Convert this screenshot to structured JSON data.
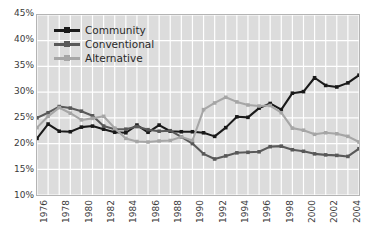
{
  "chart_data": {
    "type": "line",
    "title": "",
    "xlabel": "",
    "ylabel": "",
    "grid": true,
    "legend_position": "top-left",
    "ylim": [
      10,
      45
    ],
    "ytick_values": [
      45,
      40,
      35,
      30,
      25,
      20,
      15,
      10
    ],
    "ytick_labels": [
      "45%",
      "40%",
      "35%",
      "30%",
      "25%",
      "20%",
      "15%",
      "10%"
    ],
    "xlim": [
      1976,
      2005
    ],
    "x": [
      1976,
      1977,
      1978,
      1979,
      1980,
      1981,
      1982,
      1983,
      1984,
      1985,
      1986,
      1987,
      1988,
      1989,
      1990,
      1991,
      1992,
      1993,
      1994,
      1995,
      1996,
      1997,
      1998,
      1999,
      2000,
      2001,
      2002,
      2003,
      2004,
      2005
    ],
    "xtick_values": [
      1976,
      1978,
      1980,
      1982,
      1984,
      1986,
      1988,
      1990,
      1992,
      1994,
      1996,
      1998,
      2000,
      2002,
      2004
    ],
    "xtick_labels": [
      "1976",
      "1978",
      "1980",
      "1982",
      "1984",
      "1986",
      "1988",
      "1990",
      "1992",
      "1994",
      "1996",
      "1998",
      "2000",
      "2002",
      "2004"
    ],
    "series": [
      {
        "name": "Community",
        "color": "#1a1a1a",
        "values": [
          21.0,
          23.8,
          22.4,
          22.3,
          23.2,
          23.4,
          22.8,
          22.2,
          22.1,
          23.6,
          22.2,
          23.6,
          22.4,
          22.3,
          22.3,
          22.1,
          21.4,
          23.1,
          25.2,
          25.1,
          26.9,
          27.8,
          26.6,
          29.8,
          30.1,
          32.8,
          31.3,
          31.0,
          31.8,
          33.3
        ]
      },
      {
        "name": "Conventional",
        "color": "#595959",
        "values": [
          25.0,
          26.0,
          27.2,
          26.9,
          26.3,
          25.4,
          23.4,
          22.8,
          22.8,
          23.3,
          22.7,
          22.4,
          22.5,
          21.3,
          20.0,
          18.0,
          17.0,
          17.6,
          18.2,
          18.3,
          18.4,
          19.4,
          19.5,
          18.8,
          18.5,
          18.0,
          17.8,
          17.7,
          17.5,
          19.0
        ]
      },
      {
        "name": "Alternative",
        "color": "#a6a6a6",
        "values": [
          23.1,
          25.3,
          27.0,
          25.9,
          24.6,
          24.9,
          25.3,
          23.0,
          21.0,
          20.4,
          20.3,
          20.5,
          20.6,
          21.3,
          20.6,
          26.6,
          27.9,
          29.0,
          28.1,
          27.5,
          27.3,
          27.4,
          26.0,
          23.0,
          22.6,
          21.8,
          22.1,
          21.9,
          21.4,
          20.3
        ]
      }
    ]
  },
  "legend": {
    "items": [
      {
        "label": "Community"
      },
      {
        "label": "Conventional"
      },
      {
        "label": "Alternative"
      }
    ]
  },
  "colors": {
    "plot_background": "#dcdcdc",
    "gridline": "#ffffff",
    "plot_border": "#b4b4b4",
    "page_background": "#ffffff",
    "tick_text": "#3a3a3a"
  }
}
